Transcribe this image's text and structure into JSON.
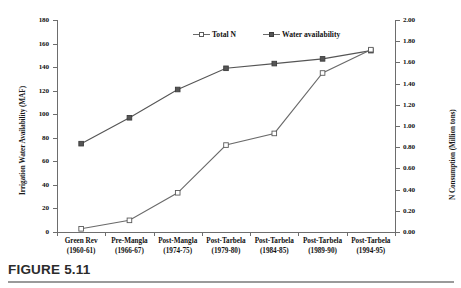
{
  "figure": {
    "caption": "FIGURE 5.11"
  },
  "legend": {
    "position": "top-center",
    "items": [
      {
        "label": "Total N",
        "marker": "open-square",
        "color": "#6a6a6a"
      },
      {
        "label": "Water availability",
        "marker": "filled-square",
        "color": "#555555"
      }
    ]
  },
  "axes": {
    "left": {
      "title": "Irrigation Water Availability (MAF)",
      "ticks": [
        "0",
        "20",
        "40",
        "60",
        "80",
        "100",
        "120",
        "140",
        "160",
        "180"
      ],
      "min": 0,
      "max": 180
    },
    "right": {
      "title": "N Consumption (Million tons)",
      "ticks": [
        "0.00",
        "0.20",
        "0.40",
        "0.60",
        "0.80",
        "1.00",
        "1.20",
        "1.40",
        "1.60",
        "1.80",
        "2.00"
      ],
      "min": 0,
      "max": 2.0
    },
    "bottom": {
      "categories": [
        {
          "line1": "Green Rev",
          "line2": "(1960-61)"
        },
        {
          "line1": "Pre-Mangla",
          "line2": "(1966-67)"
        },
        {
          "line1": "Post-Mangla",
          "line2": "(1974-75)"
        },
        {
          "line1": "Post-Tarbela",
          "line2": "(1979-80)"
        },
        {
          "line1": "Post-Tarbela",
          "line2": "(1984-85)"
        },
        {
          "line1": "Post-Tarbela",
          "line2": "(1989-90)"
        },
        {
          "line1": "Post-Tarbela",
          "line2": "(1994-95)"
        }
      ]
    }
  },
  "chart_data": {
    "type": "line",
    "title": "",
    "xlabel": "",
    "ylabel": "Irrigation Water Availability (MAF)",
    "y2label": "N Consumption (Million tons)",
    "grid": false,
    "legend_position": "top-center",
    "categories": [
      "Green Rev (1960-61)",
      "Pre-Mangla (1966-67)",
      "Post-Mangla (1974-75)",
      "Post-Tarbela (1979-80)",
      "Post-Tarbela (1984-85)",
      "Post-Tarbela (1989-90)",
      "Post-Tarbela (1994-95)"
    ],
    "ylim": [
      0,
      180
    ],
    "y2lim": [
      0,
      2.0
    ],
    "series": [
      {
        "name": "Water availability",
        "axis": "left",
        "marker": "filled-square",
        "color": "#555555",
        "values": [
          75,
          97,
          121,
          139,
          143,
          147,
          154
        ]
      },
      {
        "name": "Total N",
        "axis": "right",
        "marker": "open-square",
        "color": "#6a6a6a",
        "values": [
          0.03,
          0.11,
          0.37,
          0.82,
          0.93,
          1.5,
          1.72
        ]
      }
    ]
  }
}
